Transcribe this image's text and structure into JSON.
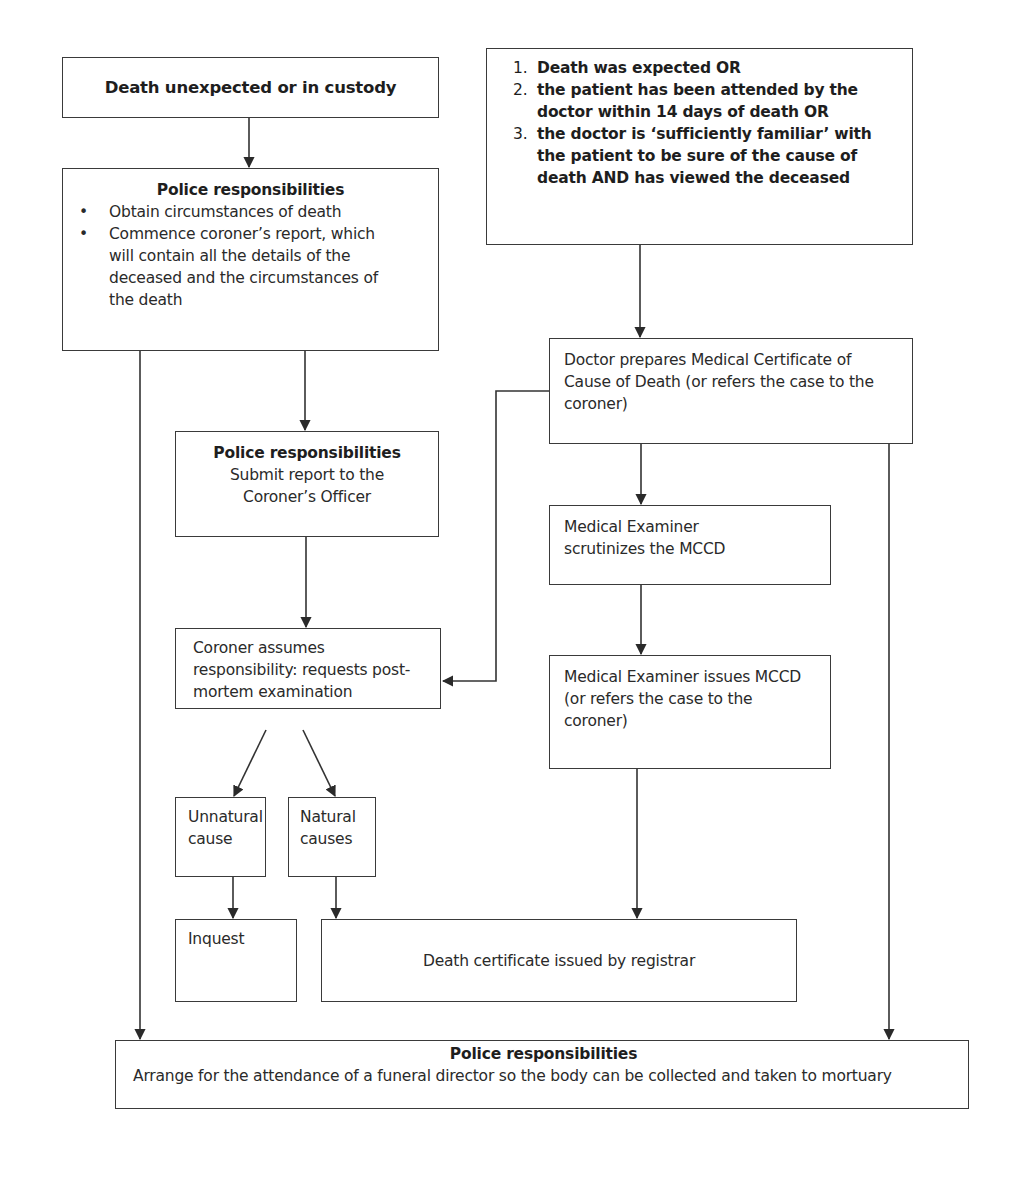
{
  "diagram": {
    "type": "flowchart",
    "nodes": {
      "death_unexpected": {
        "title": "Death unexpected or in custody"
      },
      "police_1": {
        "title": "Police responsibilities",
        "bullets": [
          "Obtain circumstances of death",
          "Commence coroner’s report, which will contain all the details of the deceased and the circumstances of the death"
        ]
      },
      "criteria": {
        "items": [
          {
            "num": "1.",
            "text": "Death was expected OR"
          },
          {
            "num": "2.",
            "text": "the patient has been attended by the doctor within 14 days of death OR"
          },
          {
            "num": "3.",
            "text": "the doctor is ‘sufficiently familiar’ with the patient to be sure of the cause  of death AND has viewed the deceased"
          }
        ]
      },
      "doctor_mccd": {
        "text": "Doctor prepares Medical Certificate of Cause of Death (or refers the case to the coroner)"
      },
      "police_2": {
        "title": "Police responsibilities",
        "text": "Submit report to the Coroner’s Officer"
      },
      "me_scrutinizes": {
        "text": "Medical Examiner scrutinizes the MCCD"
      },
      "coroner": {
        "text": "Coroner assumes responsibility: requests post-mortem examination"
      },
      "me_issues": {
        "text": "Medical Examiner issues MCCD (or refers the case to the coroner)"
      },
      "unnatural": {
        "text": "Unnatural cause"
      },
      "natural": {
        "text": "Natural causes"
      },
      "inquest": {
        "text": "Inquest"
      },
      "death_cert": {
        "text": "Death certificate issued by registrar"
      },
      "police_final": {
        "title": "Police responsibilities",
        "text": "Arrange for the attendance of a funeral director so the body can be collected and taken to mortuary"
      }
    },
    "edges": [
      [
        "death_unexpected",
        "police_1"
      ],
      [
        "police_1",
        "police_2"
      ],
      [
        "police_1",
        "police_final"
      ],
      [
        "criteria",
        "doctor_mccd"
      ],
      [
        "doctor_mccd",
        "coroner"
      ],
      [
        "doctor_mccd",
        "me_scrutinizes"
      ],
      [
        "doctor_mccd",
        "police_final"
      ],
      [
        "police_2",
        "coroner"
      ],
      [
        "me_scrutinizes",
        "me_issues"
      ],
      [
        "coroner",
        "unnatural"
      ],
      [
        "coroner",
        "natural"
      ],
      [
        "unnatural",
        "inquest"
      ],
      [
        "natural",
        "death_cert"
      ],
      [
        "me_issues",
        "death_cert"
      ]
    ]
  }
}
